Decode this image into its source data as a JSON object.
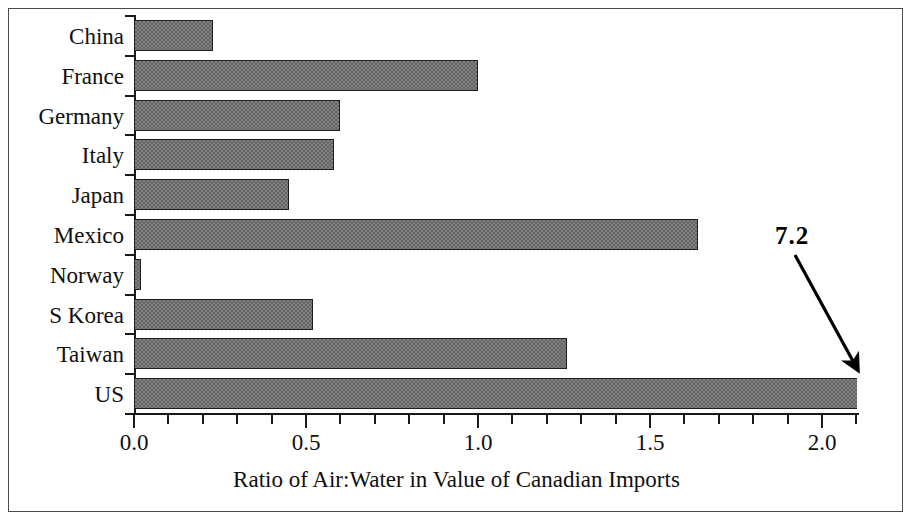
{
  "chart_data": {
    "type": "bar",
    "orientation": "horizontal",
    "title": "",
    "xlabel": "Ratio of Air:Water in Value of Canadian Imports",
    "ylabel": "",
    "categories": [
      "China",
      "France",
      "Germany",
      "Italy",
      "Japan",
      "Mexico",
      "Norway",
      "S Korea",
      "Taiwan",
      "US"
    ],
    "values": [
      0.23,
      1.0,
      0.6,
      0.58,
      0.45,
      1.64,
      0.02,
      0.52,
      1.26,
      7.2
    ],
    "xlim": [
      0.0,
      2.1
    ],
    "xtick_labels": [
      "0.0",
      "0.5",
      "1.0",
      "1.5",
      "2.0"
    ],
    "xtick_values": [
      0.0,
      0.5,
      1.0,
      1.5,
      2.0
    ],
    "minor_tick_interval": 0.1,
    "grid": false,
    "legend": null,
    "bar_color": "#808080",
    "bar_edge_color": "#1f1f1f",
    "annotations": [
      {
        "text": "7.2",
        "target_category": "US",
        "note": "US bar extends off-scale; actual value 7.2, bar clipped at plot edge"
      }
    ]
  },
  "axis": {
    "x_title": "Ratio of Air:Water in Value of Canadian Imports",
    "ticks": [
      {
        "label": "0.0",
        "value": 0.0
      },
      {
        "label": "0.5",
        "value": 0.5
      },
      {
        "label": "1.0",
        "value": 1.0
      },
      {
        "label": "1.5",
        "value": 1.5
      },
      {
        "label": "2.0",
        "value": 2.0
      }
    ]
  },
  "categories": [
    {
      "label": "China",
      "value": 0.23
    },
    {
      "label": "France",
      "value": 1.0
    },
    {
      "label": "Germany",
      "value": 0.6
    },
    {
      "label": "Italy",
      "value": 0.58
    },
    {
      "label": "Japan",
      "value": 0.45
    },
    {
      "label": "Mexico",
      "value": 1.64
    },
    {
      "label": "Norway",
      "value": 0.02
    },
    {
      "label": "S Korea",
      "value": 0.52
    },
    {
      "label": "Taiwan",
      "value": 1.26
    },
    {
      "label": "US",
      "value": 7.2
    }
  ],
  "annotation": {
    "value_label": "7.2"
  }
}
